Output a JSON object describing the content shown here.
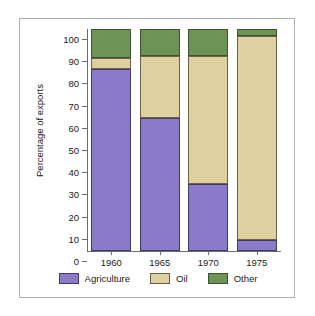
{
  "chart_data": {
    "type": "bar",
    "subtype": "stacked-bar",
    "title": "",
    "xlabel": "",
    "ylabel": "Percentage of exports",
    "categories": [
      "1960",
      "1965",
      "1970",
      "1975"
    ],
    "series": [
      {
        "name": "Agriculture",
        "color": "#8a7bc8",
        "values": [
          82,
          60,
          30,
          5
        ]
      },
      {
        "name": "Oil",
        "color": "#ddd1a0",
        "values": [
          5,
          28,
          58,
          92
        ]
      },
      {
        "name": "Other",
        "color": "#6e9455",
        "values": [
          13,
          12,
          12,
          3
        ]
      }
    ],
    "ylim": [
      0,
      100
    ],
    "yticks": [
      0,
      10,
      20,
      30,
      40,
      50,
      60,
      70,
      80,
      90,
      100
    ],
    "ytick_labels": [
      "0",
      "10",
      "20",
      "30",
      "40",
      "50",
      "60",
      "70",
      "80",
      "90",
      "100"
    ],
    "grid": false,
    "legend_position": "bottom",
    "stack_tops": {
      "1960": {
        "agriculture": 82,
        "oil": 87,
        "other": 100
      },
      "1965": {
        "agriculture": 60,
        "oil": 88,
        "other": 100
      },
      "1970": {
        "agriculture": 30,
        "oil": 88,
        "other": 100
      },
      "1975": {
        "agriculture": 5,
        "oil": 97,
        "other": 100
      }
    }
  },
  "legend": {
    "items": [
      {
        "label": "Agriculture",
        "swatch": "agriculture-swatch"
      },
      {
        "label": "Oil",
        "swatch": "oil-swatch"
      },
      {
        "label": "Other",
        "swatch": "other-swatch"
      }
    ]
  }
}
